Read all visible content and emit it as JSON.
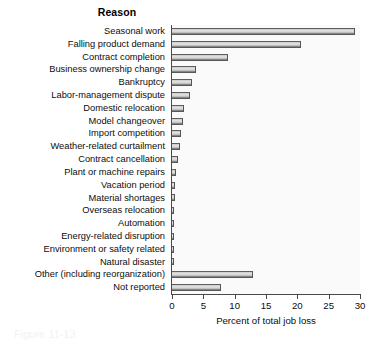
{
  "chart_data": {
    "type": "bar",
    "orientation": "horizontal",
    "title": "Reason",
    "xlabel": "Percent of total job loss",
    "ylabel": "",
    "xlim": [
      0,
      30
    ],
    "xticks": [
      0,
      5,
      10,
      15,
      20,
      25,
      30
    ],
    "grid": false,
    "legend": null,
    "categories": [
      "Seasonal work",
      "Falling product demand",
      "Contract completion",
      "Business ownership change",
      "Bankruptcy",
      "Labor-management dispute",
      "Domestic relocation",
      "Model changeover",
      "Import competition",
      "Weather-related curtailment",
      "Contract cancellation",
      "Plant or machine repairs",
      "Vacation period",
      "Material shortages",
      "Overseas relocation",
      "Automation",
      "Energy-related disruption",
      "Environment or safety related",
      "Natural disaster",
      "Other (including reorganization)",
      "Not reported"
    ],
    "values": [
      29.2,
      20.6,
      8.9,
      3.9,
      3.2,
      2.8,
      1.9,
      1.7,
      1.5,
      1.3,
      0.9,
      0.7,
      0.5,
      0.4,
      0.3,
      0.25,
      0.2,
      0.2,
      0.15,
      12.9,
      7.8
    ]
  },
  "caption_ghost": "Figure 11-13"
}
